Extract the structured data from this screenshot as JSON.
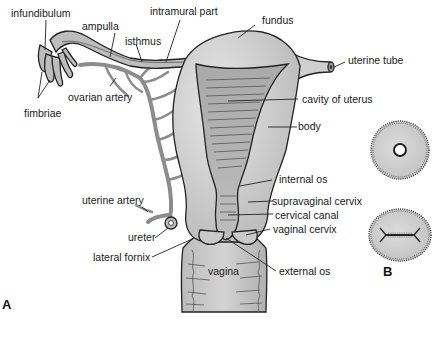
{
  "figure": {
    "panels": [
      "A",
      "B"
    ],
    "colors": {
      "tissue_light": "#d9d9d9",
      "tissue_mid": "#c4c4c4",
      "tissue_dark": "#a8a8a8",
      "artery": "#8c8c8c",
      "outline": "#222222"
    }
  },
  "labels": {
    "infundibulum": "infundibulum",
    "ampulla": "ampulla",
    "intramural_part": "intramural part",
    "fundus": "fundus",
    "isthmus": "isthmus",
    "uterine_tube": "uterine tube",
    "ovarian_artery": "ovarian artery",
    "fimbriae": "fimbriae",
    "cavity_of_uterus": "cavity of uterus",
    "body": "body",
    "internal_os": "internal os",
    "uterine_artery": "uterine artery",
    "supravaginal_cervix": "supravaginal cervix",
    "cervical_canal": "cervical canal",
    "ureter": "ureter",
    "vaginal_cervix": "vaginal cervix",
    "lateral_fornix": "lateral fornix",
    "vagina": "vagina",
    "external_os": "external os"
  },
  "panel_labels": {
    "a": "A",
    "b": "B"
  }
}
